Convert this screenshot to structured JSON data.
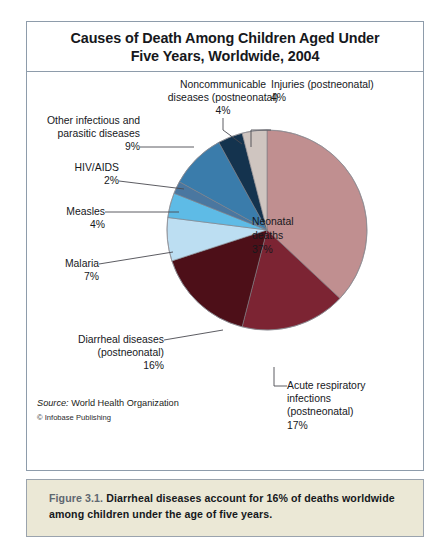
{
  "figure": {
    "title_line1": "Causes of Death Among Children Aged Under",
    "title_line2": "Five Years, Worldwide, 2004",
    "source_key": "Source:",
    "source_value": " World Health Organization",
    "copyright": "© Infobase Publishing",
    "caption_number": "Figure 3.1.",
    "caption_body": " Diarrheal diseases account for 16% of deaths worldwide among children under the age of five years.",
    "caption_bg": "#ebe8d6",
    "frame_border": "#8e9cab"
  },
  "chart_data": {
    "type": "pie",
    "title": "Causes of Death Among Children Aged Under Five Years, Worldwide, 2004",
    "subtitle": "",
    "xlabel": "",
    "ylabel": "",
    "units": "percent of deaths",
    "legend_position": "callout-labels",
    "grid": false,
    "start_angle_deg": 0,
    "direction": "clockwise",
    "total": 100,
    "categories": [
      "Neonatal deaths",
      "Acute respiratory infections (postneonatal)",
      "Diarrheal diseases (postneonatal)",
      "Malaria",
      "Measles",
      "HIV/AIDS",
      "Other infectious and parasitic diseases",
      "Noncommunicable diseases (postneonatal)",
      "Injuries (postneonatal)"
    ],
    "values": [
      37,
      17,
      16,
      7,
      4,
      2,
      9,
      4,
      4
    ],
    "colors": [
      "#c08f90",
      "#7c2433",
      "#4d0f18",
      "#bcdef2",
      "#5ebbe6",
      "#4a77a0",
      "#3a7cab",
      "#14334e",
      "#cfc5c0"
    ],
    "labels": [
      {
        "name": "Neonatal deaths",
        "value": 37,
        "display": "Neonatal\ndeaths\n37%"
      },
      {
        "name": "Acute respiratory infections (postneonatal)",
        "value": 17,
        "display": "Acute respiratory\ninfections\n(postneonatal)\n17%"
      },
      {
        "name": "Diarrheal diseases (postneonatal)",
        "value": 16,
        "display": "Diarrheal diseases\n(postneonatal)\n16%"
      },
      {
        "name": "Malaria",
        "value": 7,
        "display": "Malaria\n7%"
      },
      {
        "name": "Measles",
        "value": 4,
        "display": "Measles\n4%"
      },
      {
        "name": "HIV/AIDS",
        "value": 2,
        "display": "HIV/AIDS\n2%"
      },
      {
        "name": "Other infectious and parasitic diseases",
        "value": 9,
        "display": "Other infectious and\nparasitic diseases\n9%"
      },
      {
        "name": "Noncommunicable diseases (postneonatal)",
        "value": 4,
        "display": "Noncommunicable\ndiseases (postneonatal)\n4%"
      },
      {
        "name": "Injuries (postneonatal)",
        "value": 4,
        "display": "Injuries (postneonatal)\n4%"
      }
    ]
  },
  "slice_labels": {
    "neonatal": "Neonatal\ndeaths\n37%",
    "acute_respiratory": "Acute respiratory\ninfections\n(postneonatal)\n17%",
    "diarrheal": "Diarrheal diseases\n(postneonatal)\n16%",
    "malaria": "Malaria\n7%",
    "measles": "Measles\n4%",
    "hiv_aids": "HIV/AIDS\n2%",
    "other_infectious": "Other infectious and\nparasitic diseases\n9%",
    "noncommunicable": "Noncommunicable\ndiseases (postneonatal)\n4%",
    "injuries": "Injuries (postneonatal)\n4%"
  }
}
